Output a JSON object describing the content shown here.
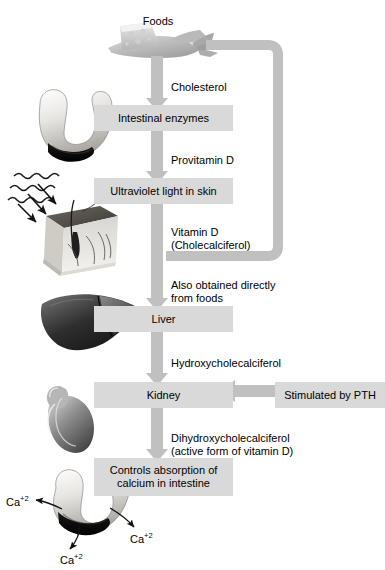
{
  "figure": {
    "title_label": "Foods",
    "boxes": [
      {
        "id": "intestinal-enzymes",
        "text": "Intestinal enzymes"
      },
      {
        "id": "ultraviolet-light-in-skin",
        "text": "Ultraviolet light in skin"
      },
      {
        "id": "liver",
        "text": "Liver"
      },
      {
        "id": "kidney",
        "text": "Kidney"
      },
      {
        "id": "stimulated-by-pth",
        "text": "Stimulated by PTH"
      },
      {
        "id": "controls-absorption",
        "text": "Controls absorption of\ncalcium in intestine"
      }
    ],
    "arrow_labels": [
      {
        "id": "cholesterol",
        "text": "Cholesterol"
      },
      {
        "id": "provitamin-d",
        "text": "Provitamin D"
      },
      {
        "id": "vitamin-d",
        "text": "Vitamin D\n(Cholecalciferol)"
      },
      {
        "id": "also-obtained",
        "text": "Also obtained directly\nfrom foods"
      },
      {
        "id": "hydroxycholecalciferol",
        "text": "Hydroxycholecalciferol"
      },
      {
        "id": "dihydroxycholecalciferol",
        "text": "Dihydroxycholecalciferol\n(active form of vitamin D)"
      }
    ],
    "ions": [
      {
        "id": "calcium-ion-left",
        "text": "Ca",
        "charge": "+2"
      },
      {
        "id": "calcium-ion-bottom",
        "text": "Ca",
        "charge": "+2"
      },
      {
        "id": "calcium-ion-right",
        "text": "Ca",
        "charge": "+2"
      }
    ],
    "illustrations": [
      {
        "id": "foods-illustration",
        "name": "foods-cheese-and-fish-illustration"
      },
      {
        "id": "intestine-illustration-top",
        "name": "intestine-illustration"
      },
      {
        "id": "sun-rays-illustration",
        "name": "ultraviolet-rays-icon"
      },
      {
        "id": "skin-illustration",
        "name": "skin-cross-section-illustration"
      },
      {
        "id": "liver-illustration",
        "name": "liver-illustration"
      },
      {
        "id": "kidney-illustration",
        "name": "kidney-illustration"
      },
      {
        "id": "intestine-illustration-bottom",
        "name": "intestine-illustration"
      }
    ],
    "colors": {
      "box_fill": "#d9d9d9",
      "arrow_fill": "#c0c0c0",
      "text": "#000000",
      "background": "#ffffff"
    }
  }
}
